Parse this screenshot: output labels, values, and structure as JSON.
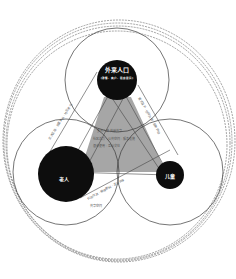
{
  "diagram": {
    "nodes": [
      {
        "id": "migrants",
        "label": "外来人口",
        "sublabel": "(游客、商户、租房居民)"
      },
      {
        "id": "elderly",
        "label": "老人"
      },
      {
        "id": "children",
        "label": "儿童"
      }
    ],
    "annotations": {
      "left_edge": "交流互动 · 邻里关系 · 社区参与",
      "right_edge": "需求互补 · 空间共享 · 服务供给",
      "bottom_edge": "代际交流 · 陪伴照料 · 活动共享",
      "bottom_edge_sub": "共享空间",
      "center_line1": "多元人群 共融共享",
      "center_line2": "社区活力 · 公共空间 · 服务设施",
      "center_line3": "混合使用 · 互动交往"
    },
    "colors": {
      "node_fill": "#0d0d0d",
      "triangle_fill": "#a6a6a6",
      "circle_stroke": "#333333",
      "outer_dashed": "#555555"
    }
  }
}
